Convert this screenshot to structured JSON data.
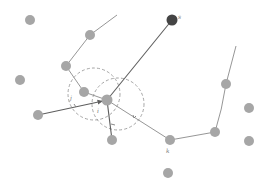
{
  "diagram": {
    "colors": {
      "node": "#a6a6a6",
      "node_dark": "#444444",
      "edge": "#8a8a8a",
      "edge_strong": "#5e5e5e",
      "ring": "#9a9a9a"
    },
    "labels": {
      "center": "i",
      "source": "s",
      "neighbor_k": "k",
      "neighbor_j": "j"
    },
    "nodes": [
      {
        "id": "n1",
        "kind": "plain"
      },
      {
        "id": "n2",
        "kind": "plain"
      },
      {
        "id": "n3",
        "kind": "plain"
      },
      {
        "id": "n4",
        "kind": "plain"
      },
      {
        "id": "j",
        "kind": "plain",
        "label": "j"
      },
      {
        "id": "i",
        "kind": "center",
        "label": "i"
      },
      {
        "id": "s",
        "kind": "dark",
        "label": "s"
      },
      {
        "id": "n8",
        "kind": "plain"
      },
      {
        "id": "n9",
        "kind": "plain"
      },
      {
        "id": "n10",
        "kind": "plain"
      },
      {
        "id": "n11",
        "kind": "plain"
      },
      {
        "id": "k",
        "kind": "plain",
        "label": "k"
      },
      {
        "id": "n13",
        "kind": "plain"
      },
      {
        "id": "n14",
        "kind": "plain"
      },
      {
        "id": "n15",
        "kind": "plain"
      }
    ],
    "edges": [
      {
        "from": "top-left-stub",
        "to": "n2"
      },
      {
        "from": "n2",
        "to": "n3"
      },
      {
        "from": "n3",
        "to": "j"
      },
      {
        "from": "j",
        "to": "i"
      },
      {
        "from": "s",
        "to": "i",
        "strong": true
      },
      {
        "from": "n8",
        "to": "i",
        "strong": true,
        "arrow": true
      },
      {
        "from": "i",
        "to": "n9",
        "strong": true
      },
      {
        "from": "i",
        "to": "k"
      },
      {
        "from": "k",
        "to": "n13"
      },
      {
        "from": "n13",
        "to": "n10"
      },
      {
        "from": "n10",
        "to": "right-stub"
      }
    ]
  }
}
